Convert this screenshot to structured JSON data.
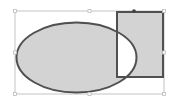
{
  "canvas": {
    "width": 175,
    "height": 108,
    "background": "#ffffff"
  },
  "colors": {
    "fill": "#d3d3d3",
    "stroke": "#505050",
    "overlap_fill": "#ffffff",
    "selection": "#b4b4b4",
    "handle": "#bdbdbd",
    "rotate_handle": "#404040"
  },
  "shapes": [
    {
      "type": "ellipse",
      "cx": 76.5,
      "cy": 57.5,
      "rx": 60,
      "ry": 35
    },
    {
      "type": "rect",
      "x": 117,
      "y": 12,
      "width": 46,
      "height": 65
    }
  ],
  "combine_mode": "exclude-overlap",
  "selection": {
    "x": 15,
    "y": 11,
    "width": 149,
    "height": 83,
    "handles": [
      [
        15,
        11
      ],
      [
        89.5,
        11
      ],
      [
        164,
        11
      ],
      [
        15,
        52.5
      ],
      [
        164,
        52.5
      ],
      [
        15,
        94
      ],
      [
        89.5,
        94
      ],
      [
        164,
        94
      ]
    ],
    "rotate_handle": [
      134,
      11
    ]
  }
}
